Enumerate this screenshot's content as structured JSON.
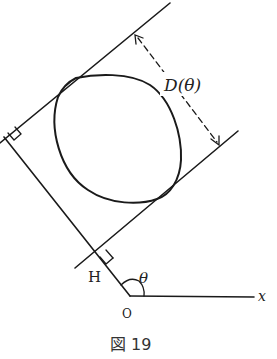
{
  "diagram": {
    "labels": {
      "width": "D(θ)",
      "theta": "θ",
      "foot": "H",
      "origin": "O",
      "x_axis": "x"
    },
    "caption": "図 19",
    "colors": {
      "stroke": "#1a1a1a",
      "background": "#ffffff"
    },
    "elements": [
      "convex-curve",
      "upper-support-line",
      "lower-support-line",
      "normal-line-through-origin",
      "x-axis",
      "width-arrow-dashed",
      "right-angle-marker-upper",
      "right-angle-marker-lower",
      "angle-arc-theta"
    ]
  }
}
